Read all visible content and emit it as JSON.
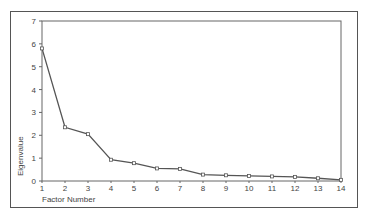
{
  "chart_data": {
    "type": "line",
    "title": "",
    "xlabel": "Factor Number",
    "ylabel": "Eigenvalue",
    "x": [
      1,
      2,
      3,
      4,
      5,
      6,
      7,
      8,
      9,
      10,
      11,
      12,
      13,
      14
    ],
    "xticks": [
      "1",
      "2",
      "3",
      "4",
      "5",
      "6",
      "7",
      "8",
      "9",
      "10",
      "11",
      "12",
      "13",
      "14"
    ],
    "yticks": [
      "0",
      "1",
      "2",
      "3",
      "4",
      "5",
      "6",
      "7"
    ],
    "ylim": [
      0,
      7
    ],
    "xlim": [
      1,
      14
    ],
    "grid": false,
    "legend": null,
    "series": [
      {
        "name": "Eigenvalue",
        "values": [
          5.8,
          2.35,
          2.05,
          0.93,
          0.78,
          0.55,
          0.53,
          0.28,
          0.25,
          0.22,
          0.2,
          0.18,
          0.12,
          0.05
        ],
        "color": "#555555",
        "marker": "square"
      }
    ]
  }
}
